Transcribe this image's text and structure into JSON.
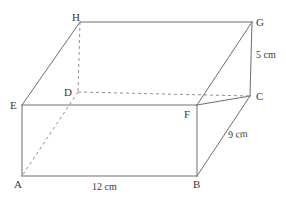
{
  "diagram": {
    "kind": "cuboid-net-3d",
    "stroke_color": "#6e6e6e",
    "hidden_stroke_color": "#8a8a8a",
    "text_color": "#3a3a3a",
    "background_color": "#ffffff",
    "vertices": [
      {
        "id": "A",
        "label": "A",
        "x": 22,
        "y": 176,
        "label_x": 14,
        "label_y": 179,
        "hidden": false
      },
      {
        "id": "B",
        "label": "B",
        "x": 197,
        "y": 176,
        "label_x": 193,
        "label_y": 179,
        "hidden": false
      },
      {
        "id": "C",
        "label": "C",
        "x": 250,
        "y": 96,
        "label_x": 256,
        "label_y": 91,
        "hidden": false
      },
      {
        "id": "D",
        "label": "D",
        "x": 78,
        "y": 92,
        "label_x": 64,
        "label_y": 87,
        "hidden": true
      },
      {
        "id": "E",
        "label": "E",
        "x": 22,
        "y": 105,
        "label_x": 10,
        "label_y": 100,
        "hidden": false
      },
      {
        "id": "F",
        "label": "F",
        "x": 197,
        "y": 105,
        "label_x": 184,
        "label_y": 109,
        "hidden": false
      },
      {
        "id": "G",
        "label": "G",
        "x": 252,
        "y": 22,
        "label_x": 256,
        "label_y": 17,
        "hidden": false
      },
      {
        "id": "H",
        "label": "H",
        "x": 80,
        "y": 22,
        "label_x": 72,
        "label_y": 12,
        "hidden": false
      }
    ],
    "edges": [
      {
        "from": "A",
        "to": "B",
        "style": "solid",
        "name": "edge-ab"
      },
      {
        "from": "B",
        "to": "F",
        "style": "solid",
        "name": "edge-bf"
      },
      {
        "from": "F",
        "to": "E",
        "style": "solid",
        "name": "edge-fe"
      },
      {
        "from": "E",
        "to": "A",
        "style": "solid",
        "name": "edge-ea"
      },
      {
        "from": "E",
        "to": "H",
        "style": "solid",
        "name": "edge-eh"
      },
      {
        "from": "H",
        "to": "G",
        "style": "solid",
        "name": "edge-hg"
      },
      {
        "from": "G",
        "to": "C",
        "style": "solid",
        "name": "edge-gc"
      },
      {
        "from": "C",
        "to": "F",
        "style": "solid",
        "name": "edge-cf"
      },
      {
        "from": "B",
        "to": "C",
        "style": "solid",
        "name": "edge-bc"
      },
      {
        "from": "F",
        "to": "G",
        "style": "solid",
        "name": "edge-fg"
      },
      {
        "from": "H",
        "to": "D",
        "style": "dashed",
        "name": "edge-hd-hidden"
      },
      {
        "from": "D",
        "to": "C",
        "style": "dashed",
        "name": "edge-dc-hidden"
      },
      {
        "from": "D",
        "to": "A",
        "style": "dashed",
        "name": "edge-da-hidden"
      }
    ],
    "dimensions": [
      {
        "id": "length",
        "text": "12 cm",
        "x": 92,
        "y": 182,
        "slanted": false,
        "edge": "AB"
      },
      {
        "id": "depth",
        "text": "9 cm",
        "x": 228,
        "y": 130,
        "slanted": true,
        "edge": "BC"
      },
      {
        "id": "height",
        "text": "5 cm",
        "x": 256,
        "y": 50,
        "slanted": false,
        "edge": "GC"
      }
    ]
  }
}
